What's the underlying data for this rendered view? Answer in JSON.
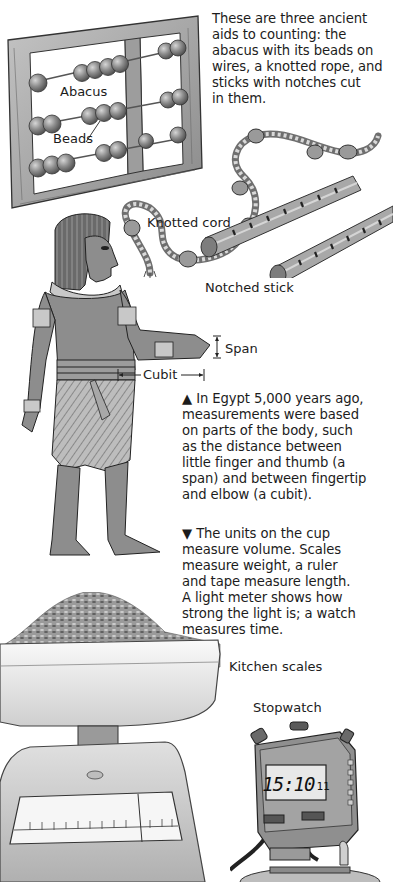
{
  "intro": {
    "lines": [
      "These are three ancient",
      "aids to counting: the",
      "abacus with its beads on",
      "wires, a knotted rope, and",
      "sticks with notches cut",
      "in them."
    ]
  },
  "labels": {
    "abacus": "Abacus",
    "beads": "Beads",
    "knotted_cord": "Knotted cord",
    "notched_stick": "Notched stick",
    "span": "Span",
    "cubit": "Cubit",
    "kitchen_scales": "Kitchen scales",
    "stopwatch": "Stopwatch"
  },
  "egypt_caption": {
    "marker": "▲",
    "lines": [
      "In Egypt 5,000 years ago,",
      "measurements were based",
      "on parts of the body, such",
      "as the distance between",
      "little finger and thumb (a",
      "span) and between fingertip",
      "and elbow (a cubit)."
    ]
  },
  "units_caption": {
    "marker": "▼",
    "lines": [
      "The units on the cup",
      "measure volume. Scales",
      "measure weight, a ruler",
      "and tape measure length.",
      "A light meter shows how",
      "strong the light is; a watch",
      "measures time."
    ]
  },
  "stopwatch_display": {
    "main": "15:10",
    "sub": "11"
  },
  "colors": {
    "wood": "#a9a9a9",
    "wood_dark": "#7c7c7c",
    "bead": "#8a8a8a",
    "skin": "#8f8f8f",
    "paper": "#ffffff",
    "text": "#1c1c1c"
  }
}
